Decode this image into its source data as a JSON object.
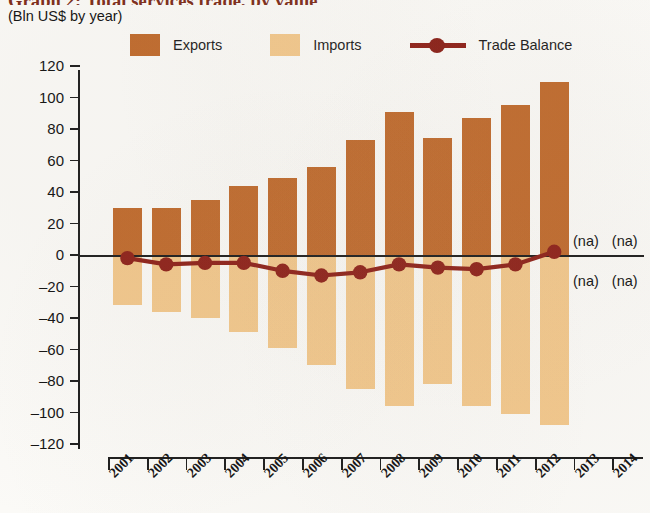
{
  "header": {
    "title": "Graph 2: Total services trade, by value",
    "subtitle": "(Bln US$ by year)"
  },
  "legend": {
    "exports_label": "Exports",
    "imports_label": "Imports",
    "balance_label": "Trade Balance",
    "exports_color": "#c06a2c",
    "imports_color": "#f3c88c",
    "balance_color": "#8e2018"
  },
  "annotations": {
    "na_top_2013": "(na)",
    "na_top_2014": "(na)",
    "na_bottom_2013": "(na)",
    "na_bottom_2014": "(na)"
  },
  "chart_data": {
    "type": "bar",
    "title": "Graph 2: Total services trade, by value",
    "subtitle": "(Bln US$ by year)",
    "xlabel": "",
    "ylabel": "Bln US$",
    "ylim": [
      -120,
      120
    ],
    "yticks": [
      120,
      100,
      80,
      60,
      40,
      20,
      0,
      -20,
      -40,
      -60,
      -80,
      -100,
      -120
    ],
    "ytick_labels": [
      "120",
      "100",
      "80",
      "60",
      "40",
      "20",
      "0",
      "–20",
      "–40",
      "–60",
      "–80",
      "–100",
      "–120"
    ],
    "categories": [
      "2001",
      "2002",
      "2003",
      "2004",
      "2005",
      "2006",
      "2007",
      "2008",
      "2009",
      "2010",
      "2011",
      "2012",
      "2013",
      "2014"
    ],
    "grid": false,
    "legend_position": "top",
    "series": [
      {
        "name": "Exports",
        "type": "bar",
        "color": "#c06a2c",
        "values": [
          30,
          30,
          35,
          44,
          49,
          56,
          73,
          91,
          74,
          87,
          95,
          110,
          null,
          null
        ]
      },
      {
        "name": "Imports",
        "type": "bar",
        "color": "#f3c88c",
        "values": [
          -32,
          -36,
          -40,
          -49,
          -59,
          -70,
          -85,
          -96,
          -82,
          -96,
          -101,
          -108,
          null,
          null
        ]
      },
      {
        "name": "Trade Balance",
        "type": "line",
        "color": "#8e2018",
        "values": [
          -2,
          -6,
          -5,
          -5,
          -10,
          -13,
          -11,
          -6,
          -8,
          -9,
          -6,
          2,
          null,
          null
        ]
      }
    ],
    "notes": [
      "(na) values shown for 2013 and 2014"
    ]
  }
}
